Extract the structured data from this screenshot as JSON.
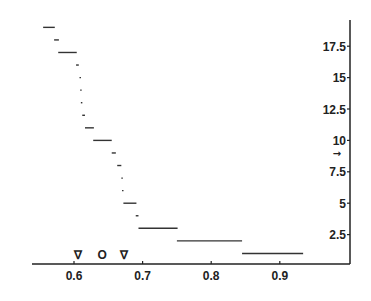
{
  "chart_data": {
    "type": "line",
    "subtype": "step-segments",
    "title": "",
    "xlabel": "",
    "ylabel": "",
    "xlim": [
      0.54,
      0.94
    ],
    "ylim": [
      0,
      19.5
    ],
    "grid": false,
    "legend": null,
    "y_axis_position": "right",
    "x_ticks": [
      0.6,
      0.7,
      0.8,
      0.9
    ],
    "x_tick_labels": [
      "0.6",
      "0.7",
      "0.8",
      "0.9"
    ],
    "y_ticks": [
      2.5,
      5,
      7.5,
      10,
      12.5,
      15,
      17.5
    ],
    "y_tick_labels": [
      "2.5",
      "5",
      "7.5",
      "10",
      "12.5",
      "15",
      "17.5"
    ],
    "segments": [
      {
        "y": 19,
        "x_start": 0.555,
        "x_end": 0.572
      },
      {
        "y": 18,
        "x_start": 0.571,
        "x_end": 0.578
      },
      {
        "y": 17,
        "x_start": 0.577,
        "x_end": 0.604
      },
      {
        "y": 16,
        "x_start": 0.603,
        "x_end": 0.607
      },
      {
        "y": 15,
        "x_start": 0.608,
        "x_end": 0.61
      },
      {
        "y": 14,
        "x_start": 0.609,
        "x_end": 0.61
      },
      {
        "y": 13,
        "x_start": 0.61,
        "x_end": 0.611
      },
      {
        "y": 12,
        "x_start": 0.612,
        "x_end": 0.616
      },
      {
        "y": 11,
        "x_start": 0.616,
        "x_end": 0.629
      },
      {
        "y": 10,
        "x_start": 0.628,
        "x_end": 0.655
      },
      {
        "y": 9,
        "x_start": 0.655,
        "x_end": 0.661
      },
      {
        "y": 8,
        "x_start": 0.663,
        "x_end": 0.669
      },
      {
        "y": 7,
        "x_start": 0.669,
        "x_end": 0.671
      },
      {
        "y": 6,
        "x_start": 0.67,
        "x_end": 0.672
      },
      {
        "y": 5,
        "x_start": 0.672,
        "x_end": 0.691
      },
      {
        "y": 4,
        "x_start": 0.69,
        "x_end": 0.694
      },
      {
        "y": 3,
        "x_start": 0.694,
        "x_end": 0.751
      },
      {
        "y": 2,
        "x_start": 0.75,
        "x_end": 0.845
      },
      {
        "y": 1,
        "x_start": 0.845,
        "x_end": 0.934
      }
    ],
    "annotations": [
      {
        "type": "marker",
        "symbol": "∇",
        "x": 0.606,
        "y": 0.6
      },
      {
        "type": "marker",
        "symbol": "O",
        "x": 0.641,
        "y": 0.6
      },
      {
        "type": "marker",
        "symbol": "∇",
        "x": 0.673,
        "y": 0.6
      },
      {
        "type": "arrow",
        "symbol": "→",
        "y": 9,
        "position": "left-of-y-axis"
      }
    ]
  },
  "layout": {
    "plot_left_px": 32,
    "plot_right_px": 350,
    "axis_bottom_px": 264,
    "axis_top_px": 20,
    "x0_value": 0.6,
    "x0_px": 74,
    "px_per_unit_x": 686,
    "y0_px": 266,
    "px_per_unit_y": 12.56
  }
}
